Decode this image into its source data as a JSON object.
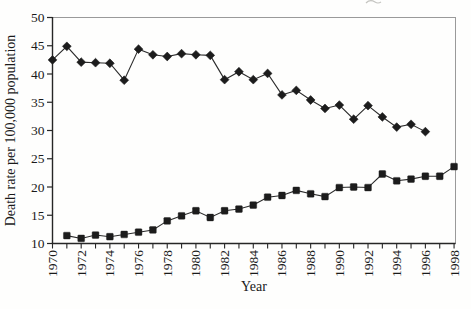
{
  "chart_data": {
    "type": "line",
    "title": "",
    "xlabel": "Year",
    "ylabel": "Death rate per 100,000 population",
    "xlim": [
      1970,
      1998.1
    ],
    "ylim": [
      10,
      50
    ],
    "grid": false,
    "legend": "none",
    "x_minor_tick_every": 1,
    "x_tick_labels": [
      "1970",
      "1972",
      "1974",
      "1976",
      "1978",
      "1980",
      "1982",
      "1984",
      "1986",
      "1988",
      "1990",
      "1992",
      "1994",
      "1996",
      "1998"
    ],
    "x_tick_label_years": [
      1970,
      1972,
      1974,
      1976,
      1978,
      1980,
      1982,
      1984,
      1986,
      1988,
      1990,
      1992,
      1994,
      1996,
      1998
    ],
    "y_ticks": [
      10,
      15,
      20,
      25,
      30,
      35,
      40,
      45,
      50
    ],
    "series": [
      {
        "name": "upper-declining-series",
        "marker": "diamond",
        "color": "#1c1c1c",
        "x": [
          1970,
          1971,
          1972,
          1973,
          1974,
          1975,
          1976,
          1977,
          1978,
          1979,
          1980,
          1981,
          1982,
          1983,
          1984,
          1985,
          1986,
          1987,
          1988,
          1989,
          1990,
          1991,
          1992,
          1993,
          1994,
          1995,
          1996
        ],
        "values": [
          42.5,
          44.9,
          42.1,
          42.0,
          41.9,
          38.9,
          44.4,
          43.4,
          43.1,
          43.6,
          43.4,
          43.3,
          39.0,
          40.4,
          39.0,
          40.1,
          36.3,
          37.1,
          35.4,
          33.9,
          34.5,
          32.0,
          34.4,
          32.4,
          30.6,
          31.1,
          29.8
        ]
      },
      {
        "name": "lower-rising-series",
        "marker": "square",
        "color": "#1c1c1c",
        "x": [
          1971,
          1972,
          1973,
          1974,
          1975,
          1976,
          1977,
          1978,
          1979,
          1980,
          1981,
          1982,
          1983,
          1984,
          1985,
          1986,
          1987,
          1988,
          1989,
          1990,
          1991,
          1992,
          1993,
          1994,
          1995,
          1996,
          1997,
          1998
        ],
        "values": [
          11.4,
          10.9,
          11.5,
          11.2,
          11.6,
          12.0,
          12.4,
          14.0,
          14.9,
          15.8,
          14.6,
          15.8,
          16.1,
          16.8,
          18.2,
          18.5,
          19.4,
          18.8,
          18.3,
          19.9,
          20.0,
          19.9,
          22.3,
          21.1,
          21.4,
          21.9,
          21.9,
          23.6
        ]
      }
    ],
    "colors": {
      "axis": "#262626",
      "frame": "#9a9a9a",
      "line": "#2b2b2b",
      "marker": "#1c1c1c",
      "background": "#fefefd"
    }
  }
}
